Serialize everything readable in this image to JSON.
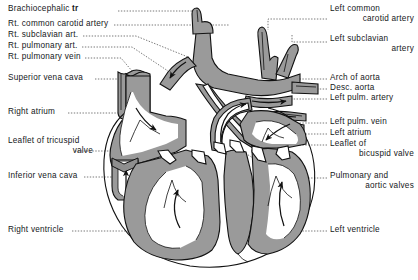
{
  "figure": {
    "background_color": "#ffffff",
    "muscle_fill_color": "#9a9a9a",
    "chamber_fill_color": "#ffffff",
    "outline_color": "#111111",
    "leader_line_color": "#555555",
    "leader_line_style": "dotted"
  },
  "labels_left": [
    {
      "id": "brachiocephalic-trunk",
      "text": "Brachiocephalic ",
      "text_bold": "tr",
      "x": 8,
      "y": 8
    },
    {
      "id": "rt-common-carotid-artery",
      "text": "Rt. common carotid artery",
      "x": 8,
      "y": 22
    },
    {
      "id": "rt-subclavian-artery",
      "text": "Rt. subclavian art.",
      "x": 8,
      "y": 33
    },
    {
      "id": "rt-pulmonary-artery",
      "text": "Rt. pulmonary art.",
      "x": 8,
      "y": 44
    },
    {
      "id": "rt-pulmonary-vein",
      "text": "Rt. pulmonary vein",
      "x": 8,
      "y": 55
    },
    {
      "id": "superior-vena-cava",
      "text": "Superior vena cava",
      "x": 8,
      "y": 76
    },
    {
      "id": "right-atrium",
      "text": "Right atrium",
      "x": 8,
      "y": 110
    },
    {
      "id": "leaflet-of-tricuspid-valve",
      "text": "Leaflet of tricuspid",
      "text_line2": "valve",
      "x": 8,
      "y": 140
    },
    {
      "id": "inferior-vena-cava",
      "text": "Inferior vena cava",
      "x": 8,
      "y": 174
    },
    {
      "id": "right-ventricle",
      "text": "Right ventricle",
      "x": 8,
      "y": 228
    }
  ],
  "labels_right": [
    {
      "id": "left-common-carotid-artery",
      "text": "Left common",
      "text_line2": "carotid artery",
      "x": 330,
      "y": 8
    },
    {
      "id": "left-subclavian-artery",
      "text": "Left subclavian",
      "text_line2": "artery",
      "x": 330,
      "y": 38
    },
    {
      "id": "arch-of-aorta",
      "text": "Arch of aorta",
      "x": 330,
      "y": 76
    },
    {
      "id": "descending-aorta",
      "text": "Desc. aorta",
      "x": 330,
      "y": 86
    },
    {
      "id": "left-pulmonary-artery",
      "text": "Left pulm. artery",
      "x": 330,
      "y": 96
    },
    {
      "id": "left-pulmonary-vein",
      "text": "Left pulm. vein",
      "x": 330,
      "y": 120
    },
    {
      "id": "left-atrium",
      "text": "Left atrium",
      "x": 330,
      "y": 131
    },
    {
      "id": "leaflet-of-bicuspid-valve",
      "text": "Leaflet of",
      "text_line2": "bicuspid valve",
      "x": 330,
      "y": 142
    },
    {
      "id": "pulmonary-and-aortic-valves",
      "text": "Pulmonary and",
      "text_line2": "aortic valves",
      "x": 330,
      "y": 174
    },
    {
      "id": "left-ventricle",
      "text": "Left ventricle",
      "x": 330,
      "y": 228
    }
  ]
}
